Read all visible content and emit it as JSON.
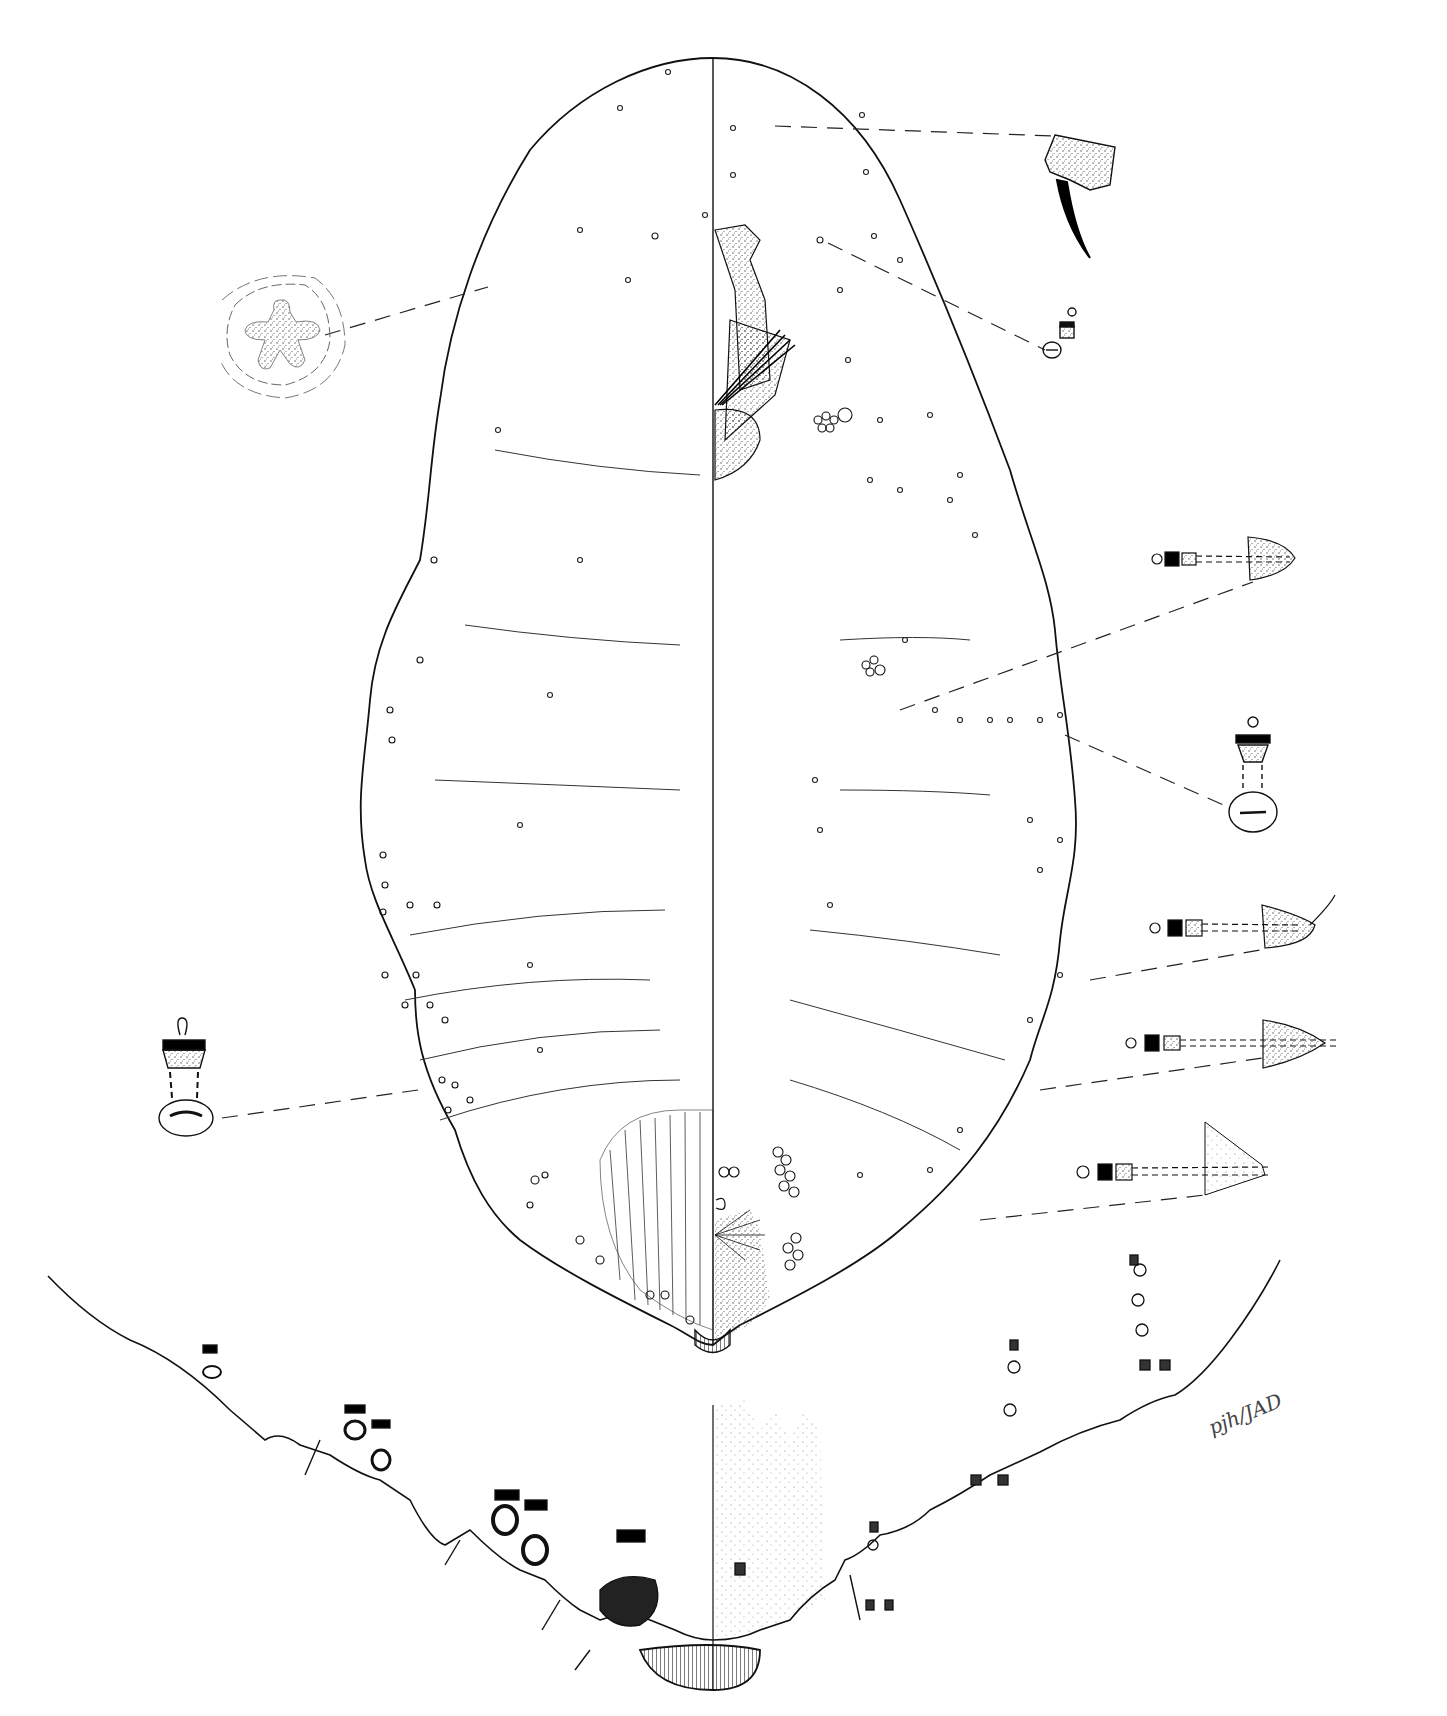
{
  "figure": {
    "type": "scientific-line-illustration",
    "signature": "pjh/JAD",
    "colors": {
      "ink": "#111111",
      "stipple": "#555555",
      "background": "#ffffff"
    },
    "panels": [
      {
        "id": "main-body",
        "label": "Whole body outline, split at midline (dorsal left / ventral right)"
      },
      {
        "id": "enlarged-posterior",
        "label": "Enlarged posterior abdomen margin with cerarii and pores"
      },
      {
        "id": "detail-multilocular-pore",
        "label": "Quinquelocular / multilocular pore detail (upper left)"
      },
      {
        "id": "detail-antenna-claw",
        "label": "Leg claw detail (upper right)"
      },
      {
        "id": "detail-tubular-duct-1",
        "label": "Oral collar tubular duct detail (right, upper)"
      },
      {
        "id": "detail-tubular-duct-2",
        "label": "Oral collar tubular duct detail (right, middle)"
      },
      {
        "id": "detail-cerarius-1",
        "label": "Cerarius / duct detail 1 (right)"
      },
      {
        "id": "detail-cerarius-2",
        "label": "Cerarius / duct detail 2 (right)"
      },
      {
        "id": "detail-cerarius-3",
        "label": "Cerarius / duct detail 3 (right)"
      },
      {
        "id": "detail-cerarius-4",
        "label": "Cerarius / duct detail 4 (right lower)"
      },
      {
        "id": "detail-dorsal-duct",
        "label": "Dorsal oral rim duct detail (left)"
      }
    ]
  }
}
